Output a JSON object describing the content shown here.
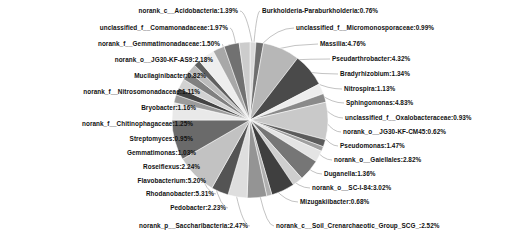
{
  "chart_data": {
    "type": "pie",
    "title": "",
    "legend_position": "labels-with-leader-lines",
    "grid": false,
    "value_unit": "percent",
    "categories": [
      "Burkholderia-Paraburkholderia",
      "unclassified_f__Micromonosporaceae",
      "Massilia",
      "Pseudarthrobacter",
      "Bradyrhizobium",
      "Nitrospira",
      "Sphingomonas",
      "unclassified_f__Oxalobacteraceae",
      "norank_o__JG30-KF-CM45",
      "Pseudomonas",
      "norank_o__Gaiellales",
      "Duganella",
      "norank_o__SC-I-84",
      "Mizugakiibacter",
      "norank_c__Soil_Crenarchaeotic_Group_SCG_",
      "norank_p__Saccharibacteria",
      "Pedobacter",
      "Rhodanobacter",
      "Flavobacterium",
      "Roseiflexus",
      "Gemmatimonas",
      "Streptomyces",
      "norank_f__Chitinophagaceae",
      "Bryobacter",
      "norank_f__Nitrosomonadaceae",
      "Mucilaginibacter",
      "norank_o__JG30-KF-AS9",
      "norank_f__Gemmatimonadaceae",
      "unclassified_f__Comamonadaceae",
      "norank_c__Acidobacteria"
    ],
    "values": [
      0.76,
      0.99,
      4.76,
      4.32,
      1.34,
      1.13,
      4.83,
      0.93,
      0.62,
      1.47,
      2.82,
      1.36,
      3.02,
      0.68,
      2.52,
      2.47,
      2.23,
      5.31,
      5.2,
      2.24,
      1.03,
      0.95,
      1.25,
      1.16,
      1.11,
      0.82,
      2.18,
      1.5,
      1.97,
      1.39
    ],
    "slice_colors": [
      "#d9d9d9",
      "#6e6e6e",
      "#b7b7b7",
      "#4a4a4a",
      "#ededed",
      "#8a8a8a",
      "#c9c9c9",
      "#5c5c5c",
      "#a0a0a0",
      "#e4e4e4",
      "#767676",
      "#cfcfcf",
      "#3f3f3f",
      "#b0b0b0",
      "#949494",
      "#dedede",
      "#545454",
      "#c2c2c2",
      "#6a6a6a",
      "#e9e9e9",
      "#9b9b9b",
      "#444444",
      "#d2d2d2",
      "#808080",
      "#bcbcbc",
      "#5f5f5f",
      "#eeeeee",
      "#a8a8a8",
      "#717171",
      "#cccccc"
    ],
    "background": "#ffffff",
    "label_color": "#111111",
    "leader_line_color": "#9a9a9a",
    "slice_border_color": "#ffffff",
    "center_x": 250,
    "center_y": 120,
    "radius": 78,
    "start_angle_deg": -90
  },
  "labels": {
    "left": [
      {
        "text": "norank_c__Acidobacteria:1.39%",
        "x": 238,
        "y": 11,
        "anchor_x": 252,
        "anchor_y": 42
      },
      {
        "text": "unclassified_f__Comamonadaceae:1.97%",
        "x": 228,
        "y": 28,
        "anchor_x": 236,
        "anchor_y": 46
      },
      {
        "text": "norank_f__Gemmatimonadaceae:1.50%",
        "x": 220,
        "y": 44,
        "anchor_x": 224,
        "anchor_y": 52
      },
      {
        "text": "norank_o__JG30-KF-AS9:2.18%",
        "x": 213,
        "y": 60,
        "anchor_x": 212,
        "anchor_y": 60
      },
      {
        "text": "Mucilaginibacter:0.82%",
        "x": 206,
        "y": 76,
        "anchor_x": 200,
        "anchor_y": 70
      },
      {
        "text": "norank_f__Nitrosomonadaceae:1.11%",
        "x": 200,
        "y": 92,
        "anchor_x": 190,
        "anchor_y": 80
      },
      {
        "text": "Bryobacter:1.16%",
        "x": 196,
        "y": 108,
        "anchor_x": 182,
        "anchor_y": 92
      },
      {
        "text": "norank_f__Chitinophagaceae:1.25%",
        "x": 193,
        "y": 124,
        "anchor_x": 176,
        "anchor_y": 104
      },
      {
        "text": "Streptomyces:0.95%",
        "x": 193,
        "y": 139,
        "anchor_x": 174,
        "anchor_y": 114
      },
      {
        "text": "Gemmatimonas:1.03%",
        "x": 196,
        "y": 153,
        "anchor_x": 174,
        "anchor_y": 126
      },
      {
        "text": "Roseiflexus:2.24%",
        "x": 200,
        "y": 167,
        "anchor_x": 178,
        "anchor_y": 138
      },
      {
        "text": "Flavobacterium:5.20%",
        "x": 206,
        "y": 181,
        "anchor_x": 186,
        "anchor_y": 152
      },
      {
        "text": "Rhodanobacter:5.31%",
        "x": 214,
        "y": 194,
        "anchor_x": 198,
        "anchor_y": 168
      },
      {
        "text": "Pedobacter:2.23%",
        "x": 226,
        "y": 208,
        "anchor_x": 214,
        "anchor_y": 182
      },
      {
        "text": "norank_p__Saccharibacteria:2.47%",
        "x": 248,
        "y": 226,
        "anchor_x": 236,
        "anchor_y": 194
      }
    ],
    "right": [
      {
        "text": "Burkholderia-Paraburkholderia:0.76%",
        "x": 262,
        "y": 11,
        "anchor_x": 254,
        "anchor_y": 42
      },
      {
        "text": "unclassified_f__Micromonosporaceae:0.99%",
        "x": 296,
        "y": 28,
        "anchor_x": 262,
        "anchor_y": 44
      },
      {
        "text": "Massilia:4.76%",
        "x": 320,
        "y": 44,
        "anchor_x": 272,
        "anchor_y": 50
      },
      {
        "text": "Pseudarthrobacter:4.32%",
        "x": 332,
        "y": 59,
        "anchor_x": 290,
        "anchor_y": 60
      },
      {
        "text": "Bradyrhizobium:1.34%",
        "x": 340,
        "y": 74,
        "anchor_x": 306,
        "anchor_y": 72
      },
      {
        "text": "Nitrospira:1.13%",
        "x": 344,
        "y": 89,
        "anchor_x": 314,
        "anchor_y": 82
      },
      {
        "text": "Sphingomonas:4.83%",
        "x": 346,
        "y": 103,
        "anchor_x": 320,
        "anchor_y": 94
      },
      {
        "text": "unclassified_f__Oxalobacteraceae:0.93%",
        "x": 345,
        "y": 118,
        "anchor_x": 326,
        "anchor_y": 110
      },
      {
        "text": "norank_o__JG30-KF-CM45:0.62%",
        "x": 343,
        "y": 132,
        "anchor_x": 326,
        "anchor_y": 122
      },
      {
        "text": "Pseudomonas:1.47%",
        "x": 340,
        "y": 146,
        "anchor_x": 322,
        "anchor_y": 134
      },
      {
        "text": "norank_o__Gaiellales:2.82%",
        "x": 334,
        "y": 160,
        "anchor_x": 314,
        "anchor_y": 148
      },
      {
        "text": "Duganella:1.36%",
        "x": 324,
        "y": 174,
        "anchor_x": 302,
        "anchor_y": 162
      },
      {
        "text": "norank_o__SC-I-84:3.02%",
        "x": 312,
        "y": 188,
        "anchor_x": 288,
        "anchor_y": 176
      },
      {
        "text": "Mizugakiibacter:0.68%",
        "x": 300,
        "y": 202,
        "anchor_x": 274,
        "anchor_y": 188
      },
      {
        "text": "norank_c__Soil_Crenarchaeotic_Group_SCG_:2.52%",
        "x": 276,
        "y": 226,
        "anchor_x": 260,
        "anchor_y": 196
      }
    ]
  }
}
